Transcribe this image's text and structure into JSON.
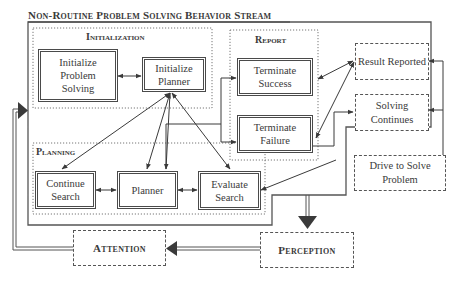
{
  "diagram": {
    "title": "Non-Routine Problem Solving Behavior Stream",
    "groups": {
      "initialization": {
        "label": "Initialization"
      },
      "report": {
        "label": "Report"
      },
      "planning": {
        "label": "Planning"
      }
    },
    "nodes": {
      "initialize_problem_solving": "Initialize Problem Solving",
      "initialize_planner": "Initialize Planner",
      "terminate_success": "Terminate Success",
      "terminate_failure": "Terminate Failure",
      "continue_search": "Continue Search",
      "planner": "Planner",
      "evaluate_search": "Evaluate Search"
    },
    "states": {
      "result_reported": "Result Reported",
      "solving_continues": "Solving Continues",
      "drive_to_solve_problem": "Drive to Solve Problem",
      "attention": "Attention",
      "perception": "Perception"
    },
    "edges": [
      {
        "from": "Initialize Problem Solving",
        "to": "Initialize Planner",
        "type": "bidirectional"
      },
      {
        "from": "Initialize Planner",
        "to": "Continue Search",
        "type": "bidirectional"
      },
      {
        "from": "Initialize Planner",
        "to": "Planner",
        "type": "bidirectional"
      },
      {
        "from": "Initialize Planner",
        "to": "Evaluate Search",
        "type": "bidirectional"
      },
      {
        "from": "Continue Search",
        "to": "Planner",
        "type": "bidirectional"
      },
      {
        "from": "Planner",
        "to": "Evaluate Search",
        "type": "bidirectional"
      },
      {
        "from": "Planner",
        "to": "Terminate Success",
        "type": "directed"
      },
      {
        "from": "Planner",
        "to": "Terminate Failure",
        "type": "directed"
      },
      {
        "from": "Terminate Success",
        "to": "Result Reported",
        "type": "bidirectional"
      },
      {
        "from": "Terminate Failure",
        "to": "Result Reported",
        "type": "bidirectional"
      },
      {
        "from": "Terminate Failure",
        "to": "Solving Continues",
        "type": "directed"
      },
      {
        "from": "Solving Continues",
        "to": "Evaluate Search",
        "type": "directed"
      },
      {
        "from": "Drive to Solve Problem",
        "to": "Result Reported",
        "type": "directed"
      },
      {
        "from": "Drive to Solve Problem",
        "to": "Solving Continues",
        "type": "directed"
      },
      {
        "from": "Behavior Stream",
        "to": "Perception",
        "type": "stream"
      },
      {
        "from": "Perception",
        "to": "Attention",
        "type": "stream"
      },
      {
        "from": "Attention",
        "to": "Behavior Stream",
        "type": "stream"
      }
    ]
  }
}
